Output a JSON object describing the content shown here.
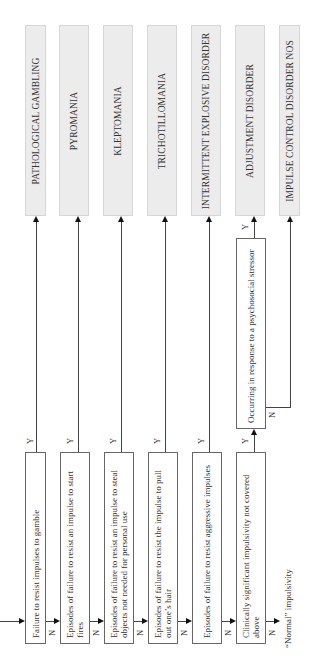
{
  "diagram": {
    "orientation": "rotated-90-ccw",
    "entry_arrow": true,
    "diagnoses": [
      {
        "id": "d1",
        "label": "PATHOLOGICAL GAMBLING"
      },
      {
        "id": "d2",
        "label": "PYROMANIA"
      },
      {
        "id": "d3",
        "label": "KLEPTOMANIA"
      },
      {
        "id": "d4",
        "label": "TRICHOTILLOMANIA"
      },
      {
        "id": "d5",
        "label": "INTERMITTENT EXPLOSIVE DISORDER"
      },
      {
        "id": "d6",
        "label": "ADJUSTMENT DISORDER"
      },
      {
        "id": "d7",
        "label": "IMPULSE CONTROL DISORDER NOS"
      }
    ],
    "decisions": [
      {
        "id": "q1",
        "text": "Failure to resist impulses to gamble",
        "yes": "PATHOLOGICAL GAMBLING",
        "no": "q2"
      },
      {
        "id": "q2",
        "text": "Episodes of failure to resist an impulse to start fires",
        "yes": "PYROMANIA",
        "no": "q3"
      },
      {
        "id": "q3",
        "text": "Episodes of failure to resist an impulse to steal objects not needed for personal use",
        "yes": "KLEPTOMANIA",
        "no": "q4"
      },
      {
        "id": "q4",
        "text": "Episodes of failure to resist the impulse to pull out one’s hair",
        "yes": "TRICHOTILLOMANIA",
        "no": "q5"
      },
      {
        "id": "q5",
        "text": "Episodes of failure to resist aggressive impulses",
        "yes": "INTERMITTENT EXPLOSIVE DISORDER",
        "no": "q6"
      },
      {
        "id": "q6",
        "text": "Clinically significant impulsivity not covered above",
        "yes": "q7",
        "no": "“Normal” impulsivity"
      },
      {
        "id": "q7",
        "text": "Occurring in response to a psychosocial stressor",
        "yes": "ADJUSTMENT DISORDER",
        "no": "IMPULSE CONTROL DISORDER NOS"
      }
    ],
    "yes_label": "Y",
    "no_label": "N",
    "terminal_note": "“Normal” impulsivity"
  }
}
